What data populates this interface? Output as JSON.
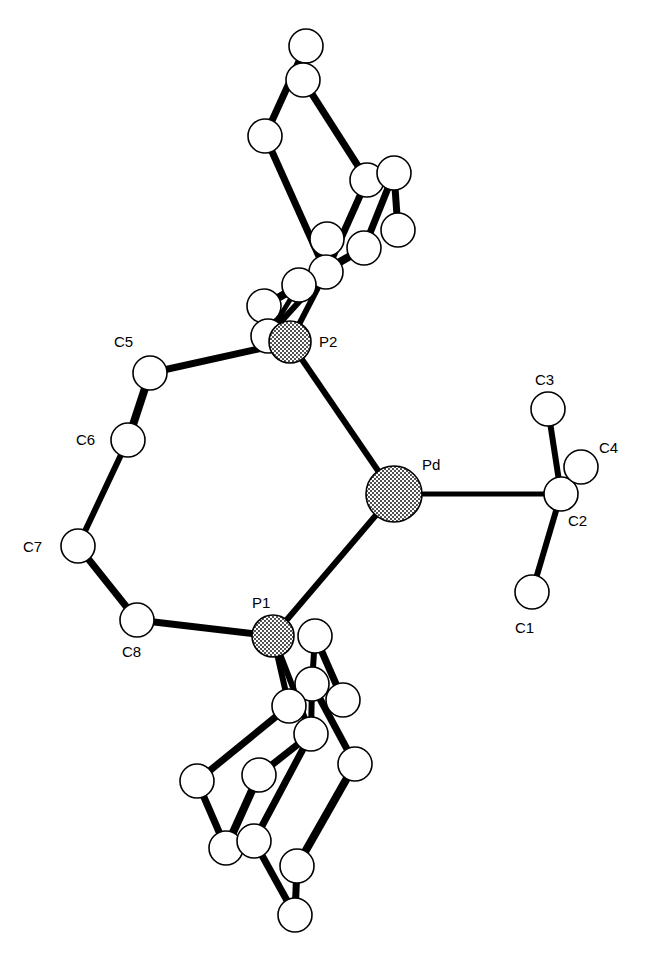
{
  "figure": {
    "type": "ORTEP molecular structure",
    "colors": {
      "bond": "#000000",
      "atom_fill": "#ffffff",
      "heavy_atom_fill": "#9a9a9a",
      "background": "#ffffff"
    }
  },
  "labels": {
    "Pd": "Pd",
    "P1": "P1",
    "P2": "P2",
    "C1": "C1",
    "C2": "C2",
    "C3": "C3",
    "C4": "C4",
    "C5": "C5",
    "C6": "C6",
    "C7": "C7",
    "C8": "C8"
  },
  "atoms": [
    {
      "id": "Pd",
      "x": 394,
      "y": 494,
      "r": 28,
      "shaded": true
    },
    {
      "id": "P1",
      "x": 273,
      "y": 636,
      "r": 21,
      "shaded": true
    },
    {
      "id": "P2",
      "x": 290,
      "y": 342,
      "r": 21,
      "shaded": true
    },
    {
      "id": "C1",
      "x": 532,
      "y": 592,
      "r": 17
    },
    {
      "id": "C2",
      "x": 561,
      "y": 494,
      "r": 17
    },
    {
      "id": "C3",
      "x": 548,
      "y": 409,
      "r": 17
    },
    {
      "id": "C4",
      "x": 581,
      "y": 467,
      "r": 17
    },
    {
      "id": "C5",
      "x": 150,
      "y": 373,
      "r": 17
    },
    {
      "id": "C6",
      "x": 128,
      "y": 440,
      "r": 17
    },
    {
      "id": "C7",
      "x": 78,
      "y": 546,
      "r": 17
    },
    {
      "id": "C8",
      "x": 137,
      "y": 620,
      "r": 17
    },
    {
      "id": "a1",
      "x": 306,
      "y": 46,
      "r": 17
    },
    {
      "id": "a2",
      "x": 303,
      "y": 80,
      "r": 17
    },
    {
      "id": "a3",
      "x": 265,
      "y": 136,
      "r": 17
    },
    {
      "id": "a4",
      "x": 367,
      "y": 180,
      "r": 17
    },
    {
      "id": "a5",
      "x": 394,
      "y": 173,
      "r": 17
    },
    {
      "id": "a6",
      "x": 398,
      "y": 230,
      "r": 17
    },
    {
      "id": "a7",
      "x": 327,
      "y": 239,
      "r": 17
    },
    {
      "id": "a8",
      "x": 364,
      "y": 248,
      "r": 17
    },
    {
      "id": "a9",
      "x": 326,
      "y": 272,
      "r": 17
    },
    {
      "id": "a10",
      "x": 299,
      "y": 285,
      "r": 17
    },
    {
      "id": "a11",
      "x": 264,
      "y": 306,
      "r": 17
    },
    {
      "id": "a12",
      "x": 268,
      "y": 336,
      "r": 17
    },
    {
      "id": "b1",
      "x": 315,
      "y": 636,
      "r": 17
    },
    {
      "id": "b2",
      "x": 312,
      "y": 684,
      "r": 17
    },
    {
      "id": "b3",
      "x": 343,
      "y": 700,
      "r": 17
    },
    {
      "id": "b4",
      "x": 289,
      "y": 706,
      "r": 17
    },
    {
      "id": "b5",
      "x": 311,
      "y": 734,
      "r": 17
    },
    {
      "id": "b6",
      "x": 355,
      "y": 764,
      "r": 17
    },
    {
      "id": "b7",
      "x": 197,
      "y": 781,
      "r": 17
    },
    {
      "id": "b8",
      "x": 259,
      "y": 775,
      "r": 17
    },
    {
      "id": "b9",
      "x": 226,
      "y": 848,
      "r": 17
    },
    {
      "id": "b10",
      "x": 254,
      "y": 841,
      "r": 17
    },
    {
      "id": "b11",
      "x": 297,
      "y": 866,
      "r": 17
    },
    {
      "id": "b12",
      "x": 295,
      "y": 915,
      "r": 17
    }
  ],
  "bonds": [
    {
      "a": "Pd",
      "b": "P2",
      "w": 6
    },
    {
      "a": "Pd",
      "b": "P1",
      "w": 6
    },
    {
      "a": "Pd",
      "b": "C2",
      "w": 5
    },
    {
      "a": "C2",
      "b": "C1",
      "w": 6
    },
    {
      "a": "C2",
      "b": "C3",
      "w": 6
    },
    {
      "a": "C2",
      "b": "C4",
      "w": 5
    },
    {
      "a": "P2",
      "b": "C5",
      "w": 7
    },
    {
      "a": "C5",
      "b": "C6",
      "w": 8
    },
    {
      "a": "C6",
      "b": "C7",
      "w": 6
    },
    {
      "a": "C7",
      "b": "C8",
      "w": 7
    },
    {
      "a": "C8",
      "b": "P1",
      "w": 7
    },
    {
      "a": "a2",
      "b": "a1",
      "w": 6
    },
    {
      "a": "a1",
      "b": "a3",
      "w": 7
    },
    {
      "a": "a2",
      "b": "a4",
      "w": 7
    },
    {
      "a": "a3",
      "b": "a9",
      "w": 7
    },
    {
      "a": "a4",
      "b": "a9",
      "w": 7
    },
    {
      "a": "a5",
      "b": "a6",
      "w": 7
    },
    {
      "a": "a5",
      "b": "a8",
      "w": 7
    },
    {
      "a": "a9",
      "b": "P2",
      "w": 6
    },
    {
      "a": "a9",
      "b": "a12",
      "w": 6
    },
    {
      "a": "a8",
      "b": "a11",
      "w": 8
    },
    {
      "a": "a10",
      "b": "a12",
      "w": 5
    },
    {
      "a": "a11",
      "b": "a12",
      "w": 5
    },
    {
      "a": "P1",
      "b": "b4",
      "w": 6
    },
    {
      "a": "P1",
      "b": "b5",
      "w": 6
    },
    {
      "a": "b1",
      "b": "b3",
      "w": 7
    },
    {
      "a": "b1",
      "b": "b2",
      "w": 6
    },
    {
      "a": "b2",
      "b": "b5",
      "w": 6
    },
    {
      "a": "b2",
      "b": "b6",
      "w": 7
    },
    {
      "a": "b4",
      "b": "b7",
      "w": 7
    },
    {
      "a": "b5",
      "b": "b8",
      "w": 7
    },
    {
      "a": "b5",
      "b": "b10",
      "w": 7
    },
    {
      "a": "b7",
      "b": "b9",
      "w": 7
    },
    {
      "a": "b8",
      "b": "b9",
      "w": 8
    },
    {
      "a": "b10",
      "b": "b12",
      "w": 7
    },
    {
      "a": "b6",
      "b": "b11",
      "w": 8
    },
    {
      "a": "b11",
      "b": "b12",
      "w": 7
    }
  ],
  "label_positions": [
    {
      "key": "Pd",
      "x": 422,
      "y": 470
    },
    {
      "key": "P1",
      "x": 252,
      "y": 608
    },
    {
      "key": "P2",
      "x": 319,
      "y": 347
    },
    {
      "key": "C1",
      "x": 515,
      "y": 633
    },
    {
      "key": "C2",
      "x": 568,
      "y": 526
    },
    {
      "key": "C3",
      "x": 535,
      "y": 385
    },
    {
      "key": "C4",
      "x": 599,
      "y": 453
    },
    {
      "key": "C5",
      "x": 114,
      "y": 347
    },
    {
      "key": "C6",
      "x": 76,
      "y": 445
    },
    {
      "key": "C7",
      "x": 23,
      "y": 552
    },
    {
      "key": "C8",
      "x": 122,
      "y": 657
    }
  ]
}
